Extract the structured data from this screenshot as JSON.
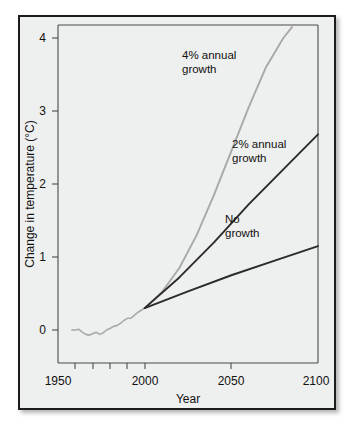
{
  "chart_data": {
    "type": "line",
    "title": "",
    "xlabel": "Year",
    "ylabel": "Change in temperature (°C)",
    "xlim": [
      1950,
      2100
    ],
    "ylim": [
      -0.5,
      4.5
    ],
    "x_ticks": [
      1950,
      2000,
      2050,
      2100
    ],
    "x_tick_labels": [
      "1950",
      "2000",
      "2050",
      "2100"
    ],
    "x_minor_ticks": [
      1960,
      1970,
      1980,
      1990,
      2000,
      2050
    ],
    "y_ticks": [
      0,
      1,
      2,
      3,
      4
    ],
    "y_tick_labels": [
      "0",
      "1",
      "2",
      "3",
      "4"
    ],
    "grid": false,
    "legend": "inline-annotations",
    "divergence_year": 2000,
    "divergence_value": 0.3,
    "series": [
      {
        "name": "Historical",
        "color": "#a9a9a9",
        "width": 1.6,
        "label": "",
        "x": [
          1958,
          1960,
          1962,
          1964,
          1966,
          1968,
          1970,
          1972,
          1974,
          1976,
          1978,
          1980,
          1982,
          1984,
          1986,
          1988,
          1990,
          1992,
          1994,
          1996,
          1998,
          2000
        ],
        "values": [
          0.0,
          0.0,
          0.01,
          -0.03,
          -0.06,
          -0.07,
          -0.05,
          -0.03,
          -0.06,
          -0.04,
          0.0,
          0.02,
          0.05,
          0.06,
          0.09,
          0.13,
          0.16,
          0.16,
          0.2,
          0.24,
          0.27,
          0.3
        ]
      },
      {
        "name": "4% annual growth",
        "color": "#a9a9a9",
        "width": 1.9,
        "label": "4% annual\ngrowth",
        "label_line_1": "4% annual",
        "label_line_2": "growth",
        "x": [
          2000,
          2010,
          2020,
          2030,
          2040,
          2050,
          2060,
          2070,
          2080,
          2085
        ],
        "values": [
          0.3,
          0.52,
          0.85,
          1.3,
          1.85,
          2.45,
          3.05,
          3.6,
          4.0,
          4.15
        ]
      },
      {
        "name": "2% annual growth",
        "color": "#2b2b2b",
        "width": 1.9,
        "label": "2% annual\ngrowth",
        "label_line_1": "2% annual",
        "label_line_2": "growth",
        "x": [
          2000,
          2020,
          2040,
          2060,
          2080,
          2100
        ],
        "values": [
          0.3,
          0.72,
          1.2,
          1.72,
          2.2,
          2.68
        ]
      },
      {
        "name": "No growth",
        "color": "#2b2b2b",
        "width": 1.9,
        "label": "No\ngrowth",
        "label_line_1": "No",
        "label_line_2": "growth",
        "x": [
          2000,
          2025,
          2050,
          2075,
          2100
        ],
        "values": [
          0.3,
          0.53,
          0.75,
          0.95,
          1.15
        ]
      }
    ],
    "annotations": [
      {
        "text": "4% annual",
        "year": 2030,
        "value": 3.72
      },
      {
        "text": "growth",
        "year": 2030,
        "value": 3.47
      },
      {
        "text": "2% annual",
        "year": 2058,
        "value": 2.52
      },
      {
        "text": "growth",
        "year": 2058,
        "value": 2.27
      },
      {
        "text": "No",
        "year": 2055,
        "value": 1.46
      },
      {
        "text": "growth",
        "year": 2055,
        "value": 1.21
      }
    ]
  },
  "axes": {
    "x_title": "Year",
    "y_title": "Change in temperature (°C)",
    "x_tick_1": "1950",
    "x_tick_2": "2000",
    "x_tick_3": "2050",
    "x_tick_4": "2100",
    "y_tick_0": "0",
    "y_tick_1": "1",
    "y_tick_2": "2",
    "y_tick_3": "3",
    "y_tick_4": "4"
  },
  "labels": {
    "four_pct_line1": "4% annual",
    "four_pct_line2": "growth",
    "two_pct_line1": "2% annual",
    "two_pct_line2": "growth",
    "no_growth_line1": "No",
    "no_growth_line2": "growth"
  },
  "colors": {
    "card_background": "#eeefef",
    "card_border": "#1c1c1c",
    "page_background": "#ffffff",
    "axis": "#4a4a4a",
    "text": "#111111",
    "light_series": "#a9a9a9",
    "dark_series": "#2b2b2b"
  }
}
